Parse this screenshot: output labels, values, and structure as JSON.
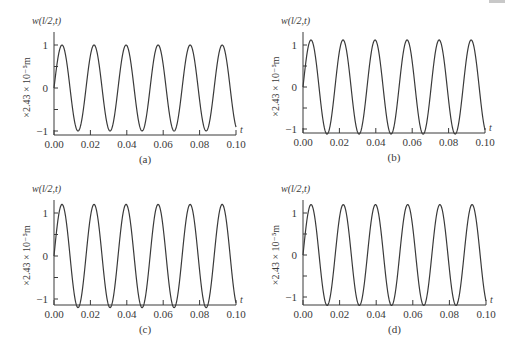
{
  "figure": {
    "panels": [
      {
        "id": "a",
        "caption": "(a)",
        "title": "w(l/2,t)",
        "ylabel": "×2.43 × 10⁻⁵m",
        "xlabel": "t",
        "xticks": [
          "0.00",
          "0.02",
          "0.04",
          "0.06",
          "0.08",
          "0.10"
        ],
        "yticks": [
          "1",
          "0",
          "−1"
        ],
        "layout": {
          "x0": 54,
          "x1": 236,
          "yAxisTop": 32,
          "xAxisY": 135,
          "yOne": 45,
          "yZero": 88,
          "yMinusOne": 130
        }
      },
      {
        "id": "b",
        "caption": "(b)",
        "title": "w(l/2,t)",
        "ylabel": "×2.43 × 10⁻⁵m",
        "xlabel": "t",
        "xticks": [
          "0.00",
          "0.02",
          "0.04",
          "0.06",
          "0.08",
          "0.10"
        ],
        "yticks": [
          "1",
          "0",
          "−1"
        ],
        "layout": {
          "x0": 303,
          "x1": 485,
          "yAxisTop": 32,
          "xAxisY": 133,
          "yOne": 45,
          "yZero": 87,
          "yMinusOne": 128
        }
      },
      {
        "id": "c",
        "caption": "(c)",
        "title": "w(l/2,t)",
        "ylabel": "×2.43 × 10⁻⁵m",
        "xlabel": "t",
        "xticks": [
          "0.00",
          "0.02",
          "0.04",
          "0.06",
          "0.08",
          "0.10"
        ],
        "yticks": [
          "1",
          "0",
          "−1"
        ],
        "layout": {
          "x0": 54,
          "x1": 236,
          "yAxisTop": 200,
          "xAxisY": 305,
          "yOne": 213,
          "yZero": 256,
          "yMinusOne": 298
        }
      },
      {
        "id": "d",
        "caption": "(d)",
        "title": "w(l/2,t)",
        "ylabel": "×2.43 × 10⁻⁵m",
        "xlabel": "t",
        "xticks": [
          "0.00",
          "0.02",
          "0.04",
          "0.06",
          "0.08",
          "0.10"
        ],
        "yticks": [
          "1",
          "0",
          "−1"
        ],
        "layout": {
          "x0": 303,
          "x1": 486,
          "yAxisTop": 200,
          "xAxisY": 305,
          "yOne": 213,
          "yZero": 255,
          "yMinusOne": 297
        }
      }
    ],
    "line_color": "#3a3a3a"
  },
  "chart_data": [
    {
      "type": "line",
      "panel": "(a)",
      "title": "w(l/2,t)",
      "xlabel": "t",
      "ylabel": "×2.43 × 10⁻⁵m",
      "xlim": [
        0.0,
        0.1
      ],
      "ylim": [
        -1.1,
        1.2
      ],
      "xticks": [
        0.0,
        0.02,
        0.04,
        0.06,
        0.08,
        0.1
      ],
      "yticks": [
        -1,
        0,
        1
      ],
      "grid": false,
      "series": [
        {
          "name": "w(l/2,t)",
          "function": "A·sin(2πt/T)",
          "amplitude": 1.0,
          "period": 0.0176,
          "x": [
            0.0,
            0.0044,
            0.0132,
            0.022,
            0.0308,
            0.0396,
            0.0484,
            0.0572,
            0.066,
            0.0748,
            0.0836,
            0.0924,
            0.1
          ],
          "y": [
            0.0,
            1.0,
            -1.0,
            1.0,
            -1.0,
            1.0,
            -1.0,
            1.0,
            -1.0,
            1.0,
            -1.0,
            1.0,
            -0.5
          ]
        }
      ]
    },
    {
      "type": "line",
      "panel": "(b)",
      "title": "w(l/2,t)",
      "xlabel": "t",
      "ylabel": "×2.43 × 10⁻⁵m",
      "xlim": [
        0.0,
        0.1
      ],
      "ylim": [
        -1.1,
        1.25
      ],
      "xticks": [
        0.0,
        0.02,
        0.04,
        0.06,
        0.08,
        0.1
      ],
      "yticks": [
        -1,
        0,
        1
      ],
      "grid": false,
      "series": [
        {
          "name": "w(l/2,t)",
          "function": "A·sin(2πt/T)",
          "amplitude": 1.12,
          "period": 0.0176,
          "x": [
            0.0,
            0.0044,
            0.0132,
            0.022,
            0.0308,
            0.0396,
            0.0484,
            0.0572,
            0.066,
            0.0748,
            0.0836,
            0.0924,
            0.1
          ],
          "y": [
            0.0,
            1.12,
            -1.12,
            1.12,
            -1.12,
            1.12,
            -1.12,
            1.12,
            -1.12,
            1.12,
            -1.12,
            1.12,
            -0.55
          ]
        }
      ]
    },
    {
      "type": "line",
      "panel": "(c)",
      "title": "w(l/2,t)",
      "xlabel": "t",
      "ylabel": "×2.43 × 10⁻⁵m",
      "xlim": [
        0.0,
        0.1
      ],
      "ylim": [
        -1.2,
        1.3
      ],
      "xticks": [
        0.0,
        0.02,
        0.04,
        0.06,
        0.08,
        0.1
      ],
      "yticks": [
        -1,
        0,
        1
      ],
      "grid": false,
      "series": [
        {
          "name": "w(l/2,t)",
          "function": "A·sin(2πt/T)",
          "amplitude": 1.2,
          "period": 0.0176,
          "x": [
            0.0,
            0.0044,
            0.0132,
            0.022,
            0.0308,
            0.0396,
            0.0484,
            0.0572,
            0.066,
            0.0748,
            0.0836,
            0.0924,
            0.1
          ],
          "y": [
            0.0,
            1.2,
            -1.2,
            1.2,
            -1.2,
            1.2,
            -1.2,
            1.2,
            -1.2,
            1.2,
            -1.2,
            1.2,
            -0.6
          ]
        }
      ]
    },
    {
      "type": "line",
      "panel": "(d)",
      "title": "w(l/2,t)",
      "xlabel": "t",
      "ylabel": "×2.43 × 10⁻⁵m",
      "xlim": [
        0.0,
        0.1
      ],
      "ylim": [
        -1.2,
        1.3
      ],
      "xticks": [
        0.0,
        0.02,
        0.04,
        0.06,
        0.08,
        0.1
      ],
      "yticks": [
        -1,
        0,
        1
      ],
      "grid": false,
      "series": [
        {
          "name": "w(l/2,t)",
          "function": "A·sin(2πt/T)",
          "amplitude": 1.2,
          "period": 0.0176,
          "x": [
            0.0,
            0.0044,
            0.0132,
            0.022,
            0.0308,
            0.0396,
            0.0484,
            0.0572,
            0.066,
            0.0748,
            0.0836,
            0.0924,
            0.1
          ],
          "y": [
            0.0,
            1.2,
            -1.2,
            1.2,
            -1.2,
            1.2,
            -1.2,
            1.2,
            -1.2,
            1.2,
            -1.2,
            1.2,
            -0.6
          ]
        }
      ]
    }
  ]
}
